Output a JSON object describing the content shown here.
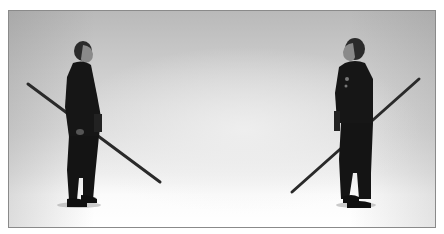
{
  "photo": {
    "description": "Black-and-white photograph of two martial artists in dark uniforms standing facing each other, each holding a long staff (bo) diagonally",
    "figures": [
      {
        "position": "left",
        "facing": "right",
        "staff": "held behind back, angled down toward center"
      },
      {
        "position": "right",
        "facing": "left",
        "staff": "held in right hand, angled down toward center"
      }
    ],
    "colors": {
      "frame_border": "#8a8a8a",
      "uniform": "#151515",
      "background_top": "#b9b9b9",
      "floor": "#ffffff"
    }
  }
}
